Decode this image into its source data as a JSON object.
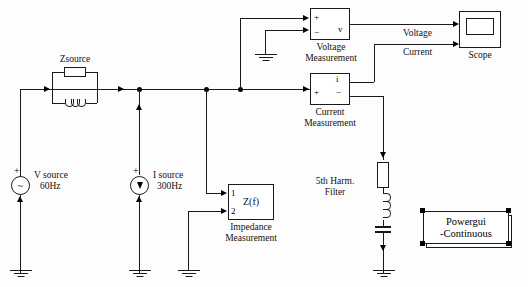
{
  "diagram": {
    "background": "#fdfdfd",
    "wire_color": "#1a1a1a"
  },
  "blocks": {
    "zsource": {
      "label": "Zsource",
      "type": "parallel-rl-branch"
    },
    "v_source": {
      "label_line1": "V source",
      "label_line2": "60Hz",
      "polarity": "+",
      "symbol": "~"
    },
    "i_source": {
      "label_line1": "I source",
      "label_line2": "300Hz",
      "polarity": "+",
      "symbol": "arrow-down"
    },
    "impedance_measurement": {
      "label_line1": "Impedance",
      "label_line2": "Measurement",
      "port1": "1",
      "port2": "2",
      "body_text": "Z(f)"
    },
    "voltage_measurement": {
      "label_line1": "Voltage",
      "label_line2": "Measurement",
      "port_plus": "+",
      "port_minus": "−",
      "port_out": "v"
    },
    "current_measurement": {
      "label_line1": "Current",
      "label_line2": "Measurement",
      "port_plus": "+",
      "port_minus": "−",
      "port_out": "i"
    },
    "harmonic_filter": {
      "label_line1": "5th Harm.",
      "label_line2": "Filter",
      "type": "series-rlc-branch"
    },
    "scope": {
      "label": "Scope"
    },
    "powergui": {
      "label_line1": "Powergui",
      "label_line2": "-Continuous",
      "selected": true
    }
  },
  "signal_labels": {
    "voltage": "Voltage",
    "current": "Current"
  }
}
